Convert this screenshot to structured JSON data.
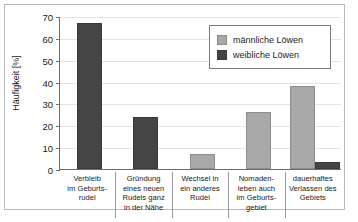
{
  "chart_data": {
    "type": "bar",
    "title": "",
    "subtitle": "",
    "xlabel": "",
    "ylabel": "Häufigkeit [%]",
    "ylim": [
      0,
      70
    ],
    "ytick_step": 10,
    "yticks": [
      "0",
      "10",
      "20",
      "30",
      "40",
      "50",
      "60",
      "70"
    ],
    "grid": "horizontal",
    "legend_position": "inside-top-right",
    "categories": [
      "Verbleib im Geburts-rudel",
      "Gründung eines neuen Rudels ganz in der Nähe",
      "Wechsel in ein anderes Rudel",
      "Nomaden-leben auch im Geburts-gebiet",
      "dauerhaftes Verlassen des Gebiets"
    ],
    "category_lines": [
      [
        "Verbleib",
        "im Geburts-",
        "rudel"
      ],
      [
        "Gründung",
        "eines neuen",
        "Rudels ganz",
        "in der Nähe"
      ],
      [
        "Wechsel in",
        "ein anderes",
        "Rudel"
      ],
      [
        "Nomaden-",
        "leben auch",
        "im Geburts-",
        "gebiet"
      ],
      [
        "dauerhaftes",
        "Verlassen des",
        "Gebiets"
      ]
    ],
    "series": [
      {
        "name": "männliche Löwen",
        "color": "#a8a8a8",
        "values": [
          0,
          0,
          6,
          25,
          37
        ]
      },
      {
        "name": "weibliche Löwen",
        "color": "#454545",
        "values": [
          66,
          23,
          0,
          0,
          2.5
        ]
      }
    ]
  },
  "legend": {
    "items": [
      {
        "label": "männliche Löwen",
        "color": "#a8a8a8"
      },
      {
        "label": "weibliche Löwen",
        "color": "#454545"
      }
    ]
  },
  "axes": {
    "y_title": "Häufigkeit [%]",
    "y_tick_0": "0",
    "y_tick_1": "10",
    "y_tick_2": "20",
    "y_tick_3": "30",
    "y_tick_4": "40",
    "y_tick_5": "50",
    "y_tick_6": "60",
    "y_tick_7": "70"
  },
  "colors": {
    "male_bar": "#a8a8a8",
    "female_bar": "#454545",
    "axis": "#6e6e6e",
    "grid": "#e3e3e3",
    "frame": "#b9b9b9",
    "text": "#1b1b1b"
  }
}
